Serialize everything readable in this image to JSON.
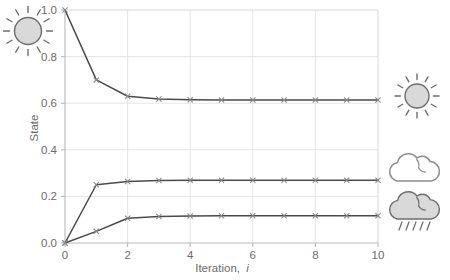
{
  "chart_data": {
    "type": "line",
    "title": "",
    "xlabel": "Iteration, i",
    "xlabel_main": "Iteration,",
    "xlabel_italic": "i",
    "ylabel": "State",
    "xlim": [
      0,
      10
    ],
    "ylim": [
      0.0,
      1.0
    ],
    "grid": true,
    "legend": "none",
    "marker": "x",
    "x": [
      0,
      1,
      2,
      3,
      4,
      5,
      6,
      7,
      8,
      9,
      10
    ],
    "xticks": [
      "0",
      "2",
      "4",
      "6",
      "8",
      "10"
    ],
    "xtick_values": [
      0,
      2,
      4,
      6,
      8,
      10
    ],
    "yticks": [
      "0.0",
      "0.2",
      "0.4",
      "0.6",
      "0.8",
      "1.0"
    ],
    "ytick_values": [
      0.0,
      0.2,
      0.4,
      0.6,
      0.8,
      1.0
    ],
    "series": [
      {
        "name": "sunny",
        "values": [
          1.0,
          0.7,
          0.63,
          0.618,
          0.615,
          0.614,
          0.614,
          0.614,
          0.614,
          0.614,
          0.614
        ]
      },
      {
        "name": "cloudy",
        "values": [
          0.0,
          0.25,
          0.264,
          0.268,
          0.269,
          0.269,
          0.269,
          0.269,
          0.269,
          0.269,
          0.269
        ]
      },
      {
        "name": "rainy",
        "values": [
          0.0,
          0.05,
          0.106,
          0.114,
          0.116,
          0.117,
          0.117,
          0.117,
          0.117,
          0.117,
          0.117
        ]
      }
    ]
  },
  "icons": {
    "top_left": "sun-icon",
    "right_top": "sun-icon",
    "right_middle": "cloud-icon",
    "right_bottom": "rain-cloud-icon"
  },
  "colors": {
    "line": "#4a4a4a",
    "marker": "#8a8a8a",
    "grid": "#e2e2e2",
    "axis": "#b9b9b9",
    "text": "#6b6b6b",
    "icon_fill": "#d9d9d9",
    "icon_stroke": "#6e6e6e",
    "background": "#ffffff"
  }
}
